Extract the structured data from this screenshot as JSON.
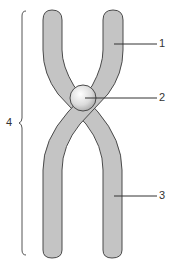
{
  "diagram": {
    "colors": {
      "chromatid_fill": "#c4c4c4",
      "outline": "#4a4a4a",
      "centromere_fill": "#e8e8e8",
      "leader": "#333333"
    },
    "labels": [
      {
        "id": "1",
        "text": "1",
        "target": "chromatid-arm-upper-right"
      },
      {
        "id": "2",
        "text": "2",
        "target": "centromere"
      },
      {
        "id": "3",
        "text": "3",
        "target": "chromatid-arm-lower-right"
      },
      {
        "id": "4",
        "text": "4",
        "target": "whole-chromosome-brace"
      }
    ]
  }
}
